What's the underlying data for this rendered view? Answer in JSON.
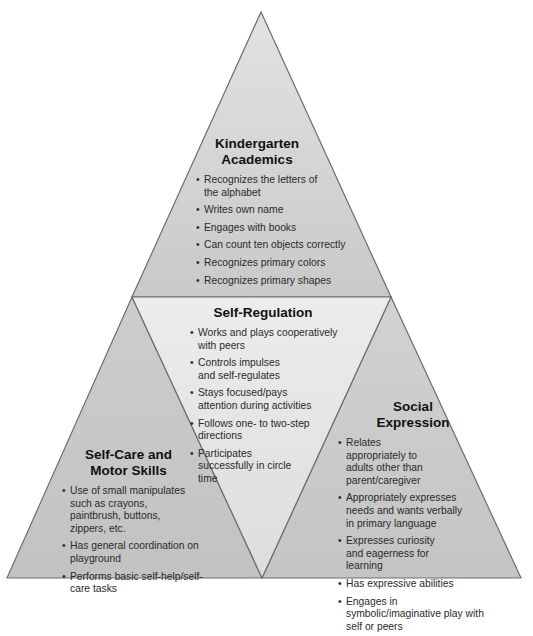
{
  "diagram": {
    "type": "pyramid",
    "colors": {
      "outer_triangle_top": "#dcdcdc",
      "outer_triangle_bottom": "#c4c4c4",
      "middle_triangle": "#e4e4e4",
      "outline": "#6e6e6e",
      "text": "#1e1e1e"
    },
    "sections": {
      "academics": {
        "title_line1": "Kindergarten",
        "title_line2": "Academics",
        "items": [
          "Recognizes the letters of the alphabet",
          "Writes own name",
          "Engages with books",
          "Can count ten objects correctly",
          "Recognizes primary colors",
          "Recognizes primary shapes"
        ]
      },
      "self_regulation": {
        "title": "Self-Regulation",
        "items": [
          "Works and plays cooperatively with peers",
          "Controls impulses and self-regulates",
          "Stays focused/pays attention during activities",
          "Follows one- to two-step directions",
          "Participates successfully in circle time"
        ]
      },
      "self_care": {
        "title_line1": "Self-Care and",
        "title_line2": "Motor Skills",
        "items": [
          "Use of small manipulates such as crayons, paintbrush, buttons, zippers, etc.",
          "Has general coordination on playground",
          "Performs basic self-help/self-care tasks"
        ]
      },
      "social": {
        "title_line1": "Social",
        "title_line2": "Expression",
        "items": [
          "Relates appropriately to adults other than parent/caregiver",
          "Appropriately expresses needs and wants verbally in primary language",
          "Expresses curiosity and eagerness for learning",
          "Has expressive abilities",
          "Engages in symbolic/imaginative play with self or peers"
        ]
      }
    },
    "bullet": "•"
  }
}
